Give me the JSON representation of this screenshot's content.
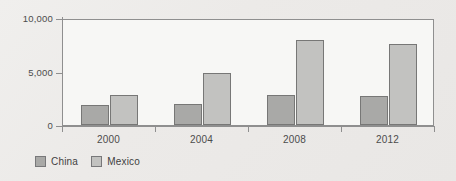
{
  "chart_data": {
    "type": "bar",
    "title": "",
    "subtitle": "",
    "xlabel": "",
    "ylabel": "",
    "categories": [
      "2000",
      "2004",
      "2008",
      "2012"
    ],
    "series": [
      {
        "name": "China",
        "color": "#a9a9a7",
        "values": [
          1880,
          1970,
          2820,
          2720
        ]
      },
      {
        "name": "Mexico",
        "color": "#c2c2c0",
        "values": [
          2820,
          4880,
          7980,
          7600
        ]
      }
    ],
    "ylim": [
      0,
      10000
    ],
    "yticks": [
      0,
      5000,
      10000
    ],
    "ytick_labels": [
      "0",
      "5,000",
      "10,000"
    ],
    "grid": false,
    "legend_position": "bottom-left",
    "annotations": []
  },
  "legend": {
    "entries": [
      {
        "label": "China"
      },
      {
        "label": "Mexico"
      }
    ]
  },
  "colors": {
    "china_bar": "#a9a9a7",
    "mexico_bar": "#c2c2c0",
    "bar_outline": "#777776",
    "axis": "#8f8f8f",
    "plot_background": "#f7f7f5",
    "page_background": "#eceae8",
    "text": "#4c4c4c"
  }
}
